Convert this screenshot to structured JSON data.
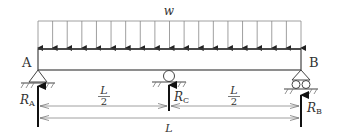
{
  "diagram": {
    "load": {
      "label": "w",
      "type": "uniformly-distributed",
      "arrow_count": 19
    },
    "beam": {
      "left_end_label": "A",
      "right_end_label": "B"
    },
    "supports": [
      {
        "id": "A",
        "type": "pin",
        "reaction_label": "R",
        "reaction_sub": "A"
      },
      {
        "id": "C",
        "type": "roller",
        "reaction_label": "R",
        "reaction_sub": "C"
      },
      {
        "id": "B",
        "type": "roller-pin",
        "reaction_label": "R",
        "reaction_sub": "B"
      }
    ],
    "dimensions": {
      "half_left": {
        "num": "L",
        "den": "2"
      },
      "half_right": {
        "num": "L",
        "den": "2"
      },
      "total": "L"
    },
    "colors": {
      "line": "#444444",
      "thin": "#888888",
      "arrow": "#111111",
      "text": "#333333"
    }
  }
}
